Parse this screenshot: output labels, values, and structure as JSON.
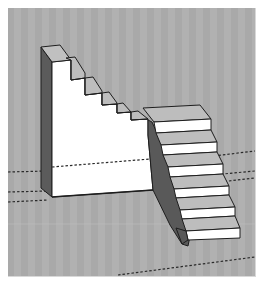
{
  "viewport": {
    "type": "3d-model-viewport",
    "background": "#a9a9a9",
    "background_stripe": "#b3b3b3",
    "frame_color": "#ffffff"
  },
  "model": {
    "name": "staircase",
    "colors": {
      "front_face": "#ffffff",
      "top_face": "#bdbdbd",
      "side_face_dark": "#595959",
      "side_face_mid": "#6e6e6e",
      "edge": "#1e1e1e"
    },
    "upper_block_steps": 5,
    "lower_stair_steps": 7
  },
  "axes": {
    "style": "dashed",
    "color": "#2a2a2a"
  }
}
